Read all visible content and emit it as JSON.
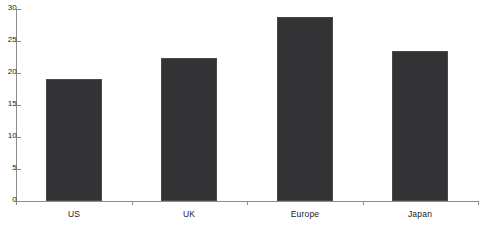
{
  "chart_data": {
    "type": "bar",
    "title": "",
    "subtitle": "",
    "xlabel": "",
    "ylabel": "",
    "categories": [
      "US",
      "UK",
      "Europe",
      "Japan"
    ],
    "values": [
      19.1,
      22.3,
      28.7,
      23.4
    ],
    "ylim": [
      0,
      30
    ],
    "ytick_labels": [
      "0",
      "5",
      "10",
      "15",
      "20",
      "25",
      "30"
    ],
    "ytick_values": [
      0,
      5,
      10,
      15,
      20,
      25,
      30
    ],
    "grid": false,
    "legend": false,
    "legend_position": "none",
    "bar_color": "#333336",
    "bar_edge_color": "#4a4a4d",
    "axis_color": "#8c8c8c",
    "background_color": "#ffffff",
    "text_color": "#1a1a1a",
    "series": [
      {
        "name": "",
        "values": [
          19.1,
          22.3,
          28.7,
          23.4
        ]
      }
    ]
  }
}
